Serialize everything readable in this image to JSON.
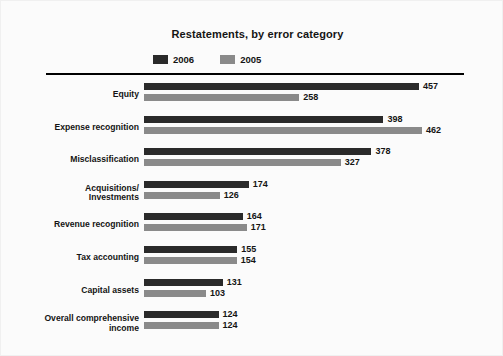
{
  "chart_data": {
    "type": "bar",
    "orientation": "horizontal",
    "title": "Restatements, by error category",
    "xlabel": "",
    "ylabel": "",
    "grid": false,
    "legend_position": "top-left",
    "xlim": [
      0,
      462
    ],
    "categories": [
      "Equity",
      "Expense recognition",
      "Misclassification",
      "Acquisitions/\nInvestments",
      "Revenue recognition",
      "Tax accounting",
      "Capital assets",
      "Overall comprehensive\nincome"
    ],
    "series": [
      {
        "name": "2006",
        "color": "#2a2a2a",
        "values": [
          457,
          398,
          378,
          174,
          164,
          155,
          131,
          124
        ]
      },
      {
        "name": "2005",
        "color": "#8a8a8a",
        "values": [
          258,
          462,
          327,
          126,
          171,
          154,
          103,
          124
        ]
      }
    ]
  },
  "legend": {
    "entries": [
      {
        "label": "2006",
        "color": "#2a2a2a"
      },
      {
        "label": "2005",
        "color": "#8a8a8a"
      }
    ]
  },
  "style": {
    "background": "#fbfbfb",
    "rule_color": "#000000",
    "text_color": "#141414"
  }
}
